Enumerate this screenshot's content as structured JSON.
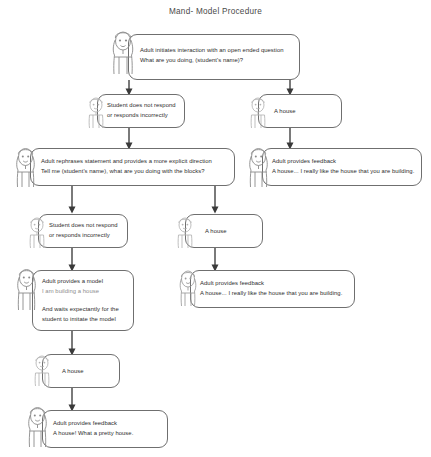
{
  "title": "Mand- Model Procedure",
  "accent_color": "#3a3a3a",
  "nodes": [
    {
      "id": "adult-initiates",
      "actor": "adult",
      "lines": [
        "Adult initiates interaction with an open ended question",
        "What are you doing, (student's name)?"
      ]
    },
    {
      "id": "student-no-respond-1",
      "actor": "student",
      "lines": [
        "Student does not respond",
        "or responds incorrectly"
      ]
    },
    {
      "id": "student-a-house-1",
      "actor": "student",
      "lines": [
        "A house"
      ]
    },
    {
      "id": "adult-rephrases",
      "actor": "adult",
      "lines": [
        "Adult rephrases statement and provides a more explicit direction",
        "Tell me (student's name), what are you doing with the blocks?"
      ]
    },
    {
      "id": "adult-feedback-1",
      "actor": "adult",
      "lines": [
        "Adult provides feedback",
        "A house... I really like the house that you are building."
      ]
    },
    {
      "id": "student-no-respond-2",
      "actor": "student",
      "lines": [
        "Student does not respond",
        "or responds incorrectly"
      ]
    },
    {
      "id": "student-a-house-2",
      "actor": "student",
      "lines": [
        "A house"
      ]
    },
    {
      "id": "adult-model",
      "actor": "adult",
      "lines": [
        "Adult provides a model",
        "I am building a house",
        "And waits expectantly for the",
        "student to imitate the model"
      ]
    },
    {
      "id": "adult-feedback-2",
      "actor": "adult",
      "lines": [
        "Adult provides feedback",
        "A house... I really like the house that you are building."
      ]
    },
    {
      "id": "student-a-house-3",
      "actor": "student",
      "lines": [
        "A house"
      ]
    },
    {
      "id": "adult-feedback-3",
      "actor": "adult",
      "lines": [
        "Adult provides feedback",
        "A house! What a pretty house."
      ]
    }
  ]
}
